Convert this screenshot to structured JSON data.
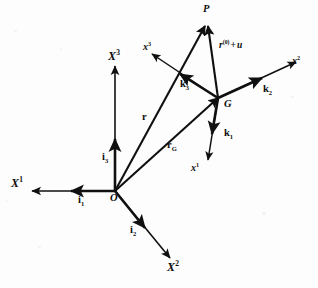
{
  "figure": {
    "background_color": "#fdfdfd",
    "ink_color": "#101010"
  },
  "global_frame": {
    "origin_label": "O",
    "axes": [
      {
        "id": "X1",
        "label": "X",
        "exponent": "1",
        "direction": "left"
      },
      {
        "id": "X2",
        "label": "X",
        "exponent": "2",
        "direction": "down-right"
      },
      {
        "id": "X3",
        "label": "X",
        "exponent": "3",
        "direction": "up"
      }
    ],
    "basis_vectors": [
      {
        "id": "i1",
        "label": "i",
        "index": "1",
        "along_axis": "X1"
      },
      {
        "id": "i2",
        "label": "i",
        "index": "2",
        "along_axis": "X2"
      },
      {
        "id": "i3",
        "label": "i",
        "index": "3",
        "along_axis": "X3"
      }
    ]
  },
  "body_frame": {
    "origin_label": "G",
    "axes": [
      {
        "id": "x1",
        "label": "x",
        "exponent": "1",
        "direction": "down"
      },
      {
        "id": "x2",
        "label": "x",
        "exponent": "2",
        "direction": "up-right"
      },
      {
        "id": "x3",
        "label": "x",
        "exponent": "3",
        "direction": "up-left"
      }
    ],
    "basis_vectors": [
      {
        "id": "k1",
        "label": "k",
        "index": "1",
        "along_axis": "x1"
      },
      {
        "id": "k2",
        "label": "k",
        "index": "2",
        "along_axis": "x2"
      },
      {
        "id": "k3",
        "label": "k",
        "index": "3",
        "along_axis": "x3"
      }
    ]
  },
  "points": [
    {
      "id": "P",
      "label": "P"
    },
    {
      "id": "G",
      "label": "G"
    },
    {
      "id": "O",
      "label": "O"
    }
  ],
  "position_vectors": [
    {
      "id": "r",
      "label": "r",
      "from": "O",
      "to": "P",
      "description": "position of P from global origin"
    },
    {
      "id": "rG",
      "label": "r",
      "index": "G",
      "from": "O",
      "to": "G",
      "description": "position of G from global origin"
    },
    {
      "id": "rel",
      "label_html": "r(0) + u",
      "base": "r",
      "exponent": "(0)",
      "operator": "+",
      "term": "u",
      "from": "G",
      "to": "P",
      "description": "relative position of P from G"
    }
  ],
  "labels": {
    "P": "P",
    "G": "G",
    "O": "O",
    "X1_base": "X",
    "X1_sup": "1",
    "X2_base": "X",
    "X2_sup": "2",
    "X3_base": "X",
    "X3_sup": "3",
    "x1_base": "x",
    "x1_sup": "1",
    "x2_base": "x",
    "x2_sup": "2",
    "x3_base": "x",
    "x3_sup": "3",
    "i1_base": "i",
    "i1_sub": "1",
    "i2_base": "i",
    "i2_sub": "2",
    "i3_base": "i",
    "i3_sub": "3",
    "k1_base": "k",
    "k1_sub": "1",
    "k2_base": "k",
    "k2_sub": "2",
    "k3_base": "k",
    "k3_sub": "3",
    "r": "r",
    "rG_base": "r",
    "rG_sub": "G",
    "rel_base": "r",
    "rel_sup": "(0)",
    "rel_plus": "+",
    "rel_u": "u"
  }
}
